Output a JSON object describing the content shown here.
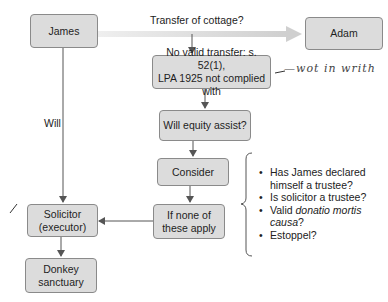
{
  "diagram": {
    "nodes": {
      "james": "James",
      "adam": "Adam",
      "no_valid_transfer": "No valid transfer: s. 52(1), LPA 1925 not complied with",
      "no_valid_transfer_line1": "No valid transfer: s. 52(1),",
      "no_valid_transfer_line2": "LPA 1925 not complied with",
      "equity": "Will equity assist?",
      "consider": "Consider",
      "if_none_line1": "If none of",
      "if_none_line2": "these apply",
      "solicitor_line1": "Solicitor",
      "solicitor_line2": "(executor)",
      "donkey_line1": "Donkey",
      "donkey_line2": "sanctuary"
    },
    "edge_labels": {
      "transfer": "Transfer of cottage?",
      "will": "Will"
    },
    "considerations": [
      {
        "text": "Has James declared himself a trustee?",
        "line1": "Has James declared",
        "line2": "himself a trustee?"
      },
      {
        "text": "Is solicitor a trustee?"
      },
      {
        "pre": "Valid ",
        "italic": "donatio mortis causa",
        "post": "?"
      },
      {
        "text": "Estoppel?"
      }
    ],
    "annotations": {
      "handwritten_note": "— not in writing",
      "handwritten_display": "—wot in writh",
      "tick_mark": "/"
    },
    "colors": {
      "box_fill": "#dcdcdc",
      "box_border": "#8a8a8a",
      "arrow": "#555555",
      "wide_arrow": "#d0d0d0"
    }
  }
}
